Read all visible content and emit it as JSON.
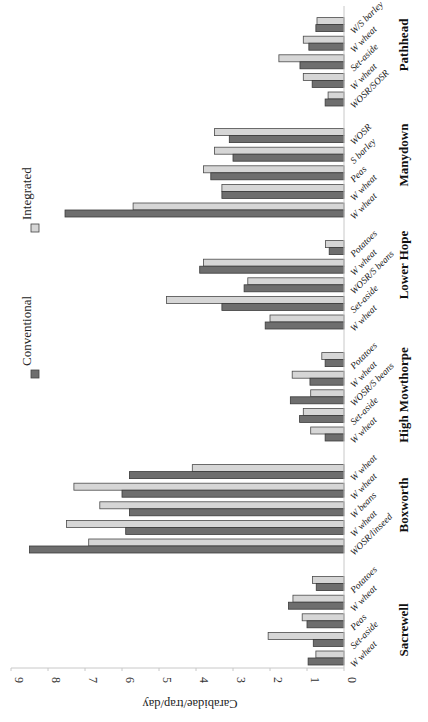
{
  "chart_data": {
    "type": "bar",
    "orientation": "horizontal (figure rotated 90°)",
    "title": "",
    "ylabel": "Carabidae/trap/day",
    "xlabel": "",
    "ylim": [
      0,
      9
    ],
    "ticks": [
      0,
      1,
      2,
      3,
      4,
      5,
      6,
      7,
      8,
      9
    ],
    "grid": false,
    "legend": {
      "position": "left (rotated, top of plot area)",
      "entries": [
        {
          "name": "Conventional",
          "color": "#6e6e6e"
        },
        {
          "name": "Integrated",
          "color": "#d6d6d6"
        }
      ]
    },
    "groups": [
      {
        "site": "Sacrewell",
        "categories": [
          "W wheat",
          "Set-aside",
          "Peas",
          "W wheat",
          "Potatoes"
        ],
        "series": [
          {
            "name": "Conventional",
            "values": [
              0.97,
              0.83,
              1.0,
              1.5,
              0.75
            ]
          },
          {
            "name": "Integrated",
            "values": [
              0.76,
              2.05,
              1.13,
              1.38,
              0.85
            ]
          }
        ]
      },
      {
        "site": "Boxworth",
        "categories": [
          "WOSR/linseed",
          "W wheat",
          "W beans",
          "W wheat",
          "W wheat"
        ],
        "series": [
          {
            "name": "Conventional",
            "values": [
              8.5,
              5.9,
              5.8,
              6.0,
              5.8
            ]
          },
          {
            "name": "Integrated",
            "values": [
              6.9,
              7.5,
              6.6,
              7.3,
              4.1
            ]
          }
        ]
      },
      {
        "site": "High Mowthorpe",
        "categories": [
          "W wheat",
          "Set-aside",
          "WOSR/S beans",
          "W wheat",
          "Potatoes"
        ],
        "series": [
          {
            "name": "Conventional",
            "values": [
              0.51,
              1.2,
              1.45,
              0.92,
              0.51
            ]
          },
          {
            "name": "Integrated",
            "values": [
              0.9,
              1.1,
              0.9,
              1.4,
              0.6
            ]
          }
        ]
      },
      {
        "site": "Lower Hope",
        "categories": [
          "W wheat",
          "Set-aside",
          "WOSR/S beans",
          "W wheat",
          "Potatoes"
        ],
        "series": [
          {
            "name": "Conventional",
            "values": [
              2.13,
              3.3,
              2.7,
              3.9,
              0.4
            ]
          },
          {
            "name": "Integrated",
            "values": [
              2.0,
              4.8,
              2.6,
              3.8,
              0.5
            ]
          }
        ]
      },
      {
        "site": "Manydown",
        "categories": [
          "W wheat",
          "W wheat",
          "Peas",
          "S barley",
          "WOSR"
        ],
        "series": [
          {
            "name": "Conventional",
            "values": [
              7.54,
              3.3,
              3.6,
              3.0,
              3.1
            ]
          },
          {
            "name": "Integrated",
            "values": [
              5.7,
              3.3,
              3.8,
              3.5,
              3.5
            ]
          }
        ]
      },
      {
        "site": "Pathhead",
        "categories": [
          "WOSR/SOSR",
          "W wheat",
          "Set-aside",
          "W wheat",
          "W/S barley"
        ],
        "series": [
          {
            "name": "Conventional",
            "values": [
              0.51,
              0.86,
              1.19,
              0.95,
              0.76
            ]
          },
          {
            "name": "Integrated",
            "values": [
              0.43,
              1.1,
              1.76,
              1.1,
              0.73
            ]
          }
        ]
      }
    ]
  },
  "layout": {
    "group_top_y": {
      "Sacrewell": 651,
      "Boxworth": 539,
      "High Mowthorpe": 427,
      "Lower Hope": 315,
      "Manydown": 203,
      "Pathhead": 92
    },
    "site_label_y": {
      "Sacrewell": 630,
      "Boxworth": 505,
      "High Mowthorpe": 395,
      "Lower Hope": 265,
      "Manydown": 155,
      "Pathhead": 45
    }
  }
}
